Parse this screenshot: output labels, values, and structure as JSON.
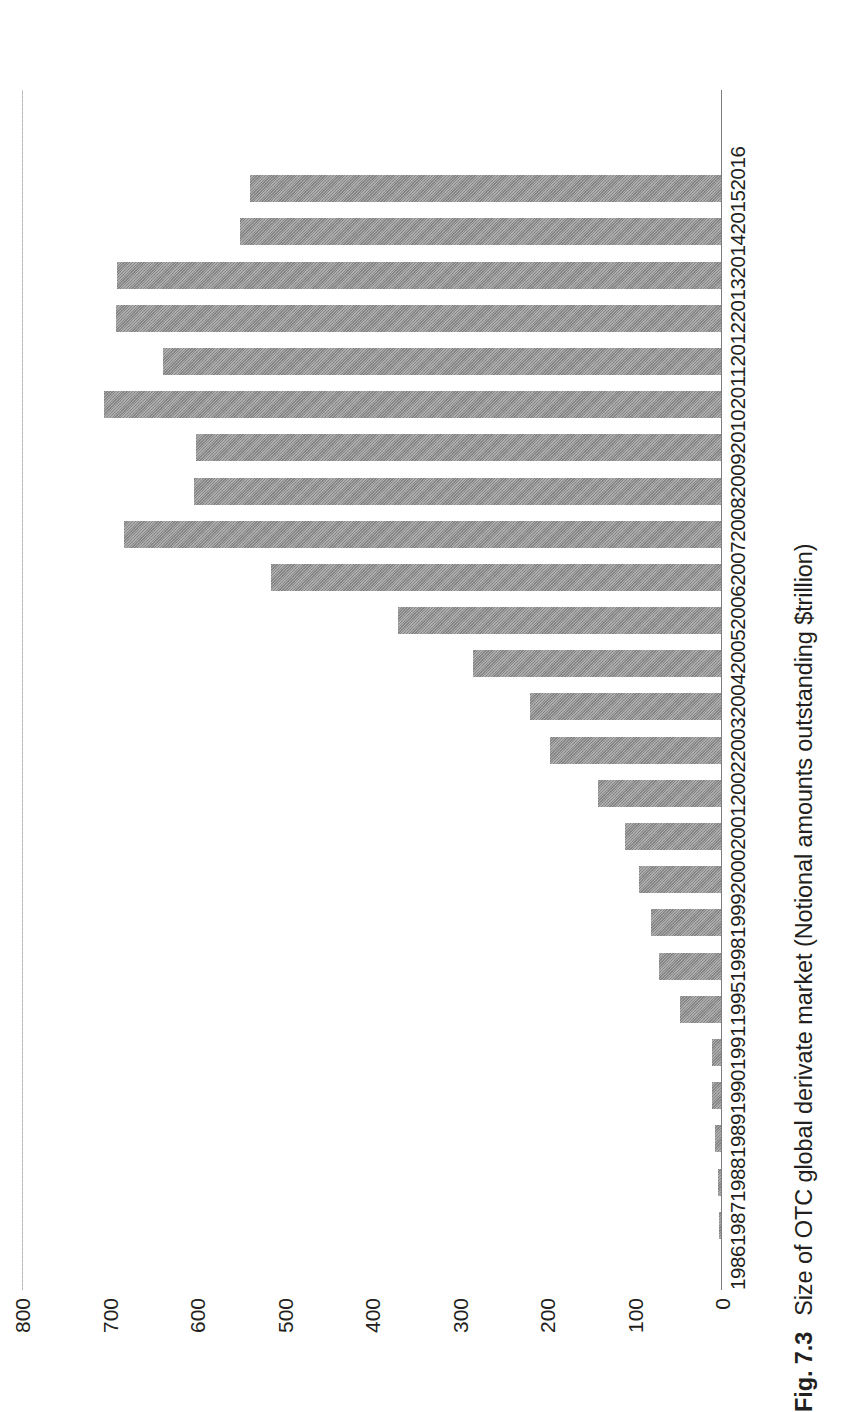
{
  "figure": {
    "number_label": "Fig. 7.3",
    "caption_text": "Size of OTC global derivate market (Notional amounts outstanding $trillion)"
  },
  "chart_data": {
    "type": "bar",
    "orientation": "vertical-bars-on-rotated-page",
    "title": "Size of OTC global derivate market (Notional amounts outstanding $trillion)",
    "xlabel": "",
    "ylabel": "",
    "ylim": [
      0,
      800
    ],
    "yticks": [
      0,
      100,
      200,
      300,
      400,
      500,
      600,
      700,
      800
    ],
    "ytick_labels": [
      "0",
      "100",
      "200",
      "300",
      "400",
      "500",
      "600",
      "700",
      "800"
    ],
    "grid": false,
    "legend": "none",
    "units": "$trillion",
    "bar_color": "#8c8c8c",
    "categories": [
      "1986",
      "1987",
      "1988",
      "1989",
      "1990",
      "1991",
      "1995",
      "1998",
      "1999",
      "2000",
      "2001",
      "2002",
      "2003",
      "2004",
      "2005",
      "2006",
      "2007",
      "2008",
      "2009",
      "2010",
      "2011",
      "2012",
      "2013",
      "2014",
      "2015",
      "2016"
    ],
    "values": [
      1,
      3,
      5,
      8,
      11,
      12,
      48,
      72,
      81,
      95,
      111,
      142,
      197,
      220,
      285,
      370,
      516,
      683,
      604,
      601,
      706,
      639,
      693,
      691,
      551,
      540
    ],
    "series_name": "Notional amounts outstanding"
  },
  "axis": {
    "value_ticks": [
      "800",
      "700",
      "600",
      "500",
      "400",
      "300",
      "200",
      "100",
      "0"
    ]
  }
}
